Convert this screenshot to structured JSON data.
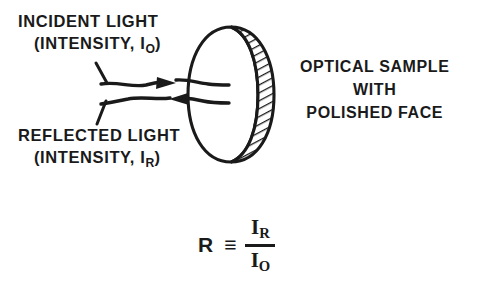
{
  "figure": {
    "type": "optical-reflectance-schematic",
    "background_color": "#ffffff",
    "ink_color": "#1a1a1a"
  },
  "labels": {
    "incident": {
      "line1": "INCIDENT LIGHT",
      "line2_prefix": "(INTENSITY, I",
      "line2_subscript": "O",
      "line2_suffix": ")"
    },
    "reflected": {
      "line1": "REFLECTED LIGHT",
      "line2_prefix": "(INTENSITY, I",
      "line2_subscript": "R",
      "line2_suffix": ")"
    },
    "sample": {
      "line1": "OPTICAL SAMPLE",
      "line2": "WITH",
      "line3": "POLISHED FACE"
    }
  },
  "formula": {
    "symbol": "R",
    "relation": "≡",
    "numerator_base": "I",
    "numerator_subscript": "R",
    "denominator_base": "I",
    "denominator_subscript": "O"
  },
  "diagram_elements": {
    "incident_ray_name": "incident-light-ray",
    "reflected_ray_name": "reflected-light-ray",
    "incident_arrow_direction": "right",
    "reflected_arrow_direction": "left",
    "sample_shape": "ellipse-disc-with-hatched-rim",
    "hatch_angle_degrees": 60
  }
}
